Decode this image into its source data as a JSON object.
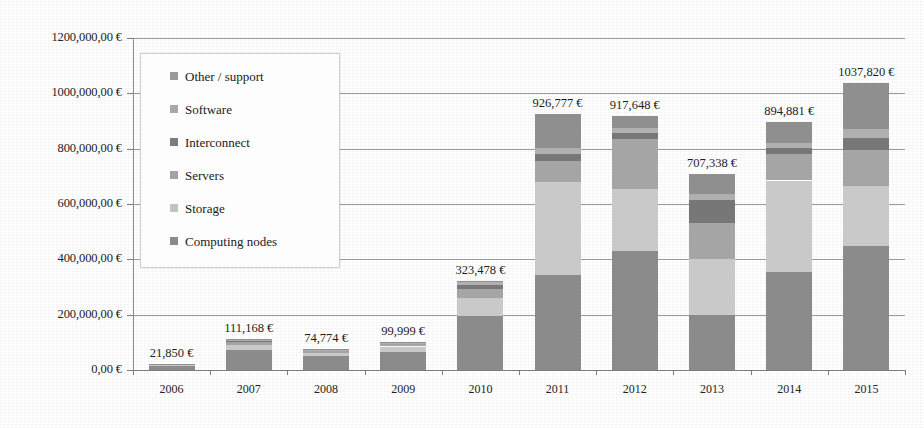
{
  "chart_data": {
    "type": "bar",
    "subtype": "stacked-bar",
    "title": "",
    "xlabel": "",
    "ylabel": "",
    "ylim": [
      0,
      1200000
    ],
    "grid": true,
    "legend_position": "inside-top-left",
    "currency_symbol": "€",
    "categories": [
      "2006",
      "2007",
      "2008",
      "2009",
      "2010",
      "2011",
      "2012",
      "2013",
      "2014",
      "2015"
    ],
    "ytick_labels": [
      "1200,000,00 €",
      "1000,000,00 €",
      "800,000,00 €",
      "600,000,00 €",
      "400,000,00 €",
      "200,000,00 €",
      "0,00 €"
    ],
    "ytick_values": [
      1200000,
      1000000,
      800000,
      600000,
      400000,
      200000,
      0
    ],
    "totals": [
      21850,
      111168,
      74774,
      99999,
      323478,
      926777,
      917648,
      707338,
      894881,
      1037820
    ],
    "total_labels": [
      "21,850 €",
      "111,168 €",
      "74,774 €",
      "99,999 €",
      "323,478 €",
      "926,777 €",
      "917,648 €",
      "707,338 €",
      "894,881 €",
      "1037,820 €"
    ],
    "series": [
      {
        "name": "Computing nodes",
        "color": "#8b8b8b",
        "values": [
          14000,
          72000,
          50000,
          66000,
          196000,
          345000,
          430000,
          200000,
          355000,
          450000
        ]
      },
      {
        "name": "Storage",
        "color": "#c9c9c9",
        "values": [
          4000,
          19000,
          13000,
          19000,
          66000,
          335000,
          225000,
          200000,
          330000,
          215000
        ]
      },
      {
        "name": "Servers",
        "color": "#a5a5a5",
        "values": [
          2000,
          9000,
          6000,
          8000,
          30000,
          75000,
          180000,
          130000,
          95000,
          130000
        ]
      },
      {
        "name": "Interconnect",
        "color": "#777777",
        "values": [
          800,
          5000,
          3000,
          4000,
          16000,
          26000,
          22000,
          85000,
          22000,
          45000
        ]
      },
      {
        "name": "Software",
        "color": "#b0b0b0",
        "values": [
          600,
          3168,
          1774,
          1999,
          8478,
          20777,
          18648,
          22338,
          18881,
          30820
        ]
      },
      {
        "name": "Other / support",
        "color": "#8f8f8f",
        "values": [
          450,
          3000,
          1000,
          1000,
          7000,
          125000,
          42000,
          70000,
          74000,
          167000
        ]
      }
    ]
  },
  "legend": {
    "items": [
      {
        "label": "Other / support",
        "color": "#9b9b9b"
      },
      {
        "label": "Software",
        "color": "#a8a8a8"
      },
      {
        "label": "Interconnect",
        "color": "#7d7d7d"
      },
      {
        "label": "Servers",
        "color": "#a2a2a2"
      },
      {
        "label": "Storage",
        "color": "#c2c2c2"
      },
      {
        "label": "Computing nodes",
        "color": "#8a8a8a"
      }
    ]
  }
}
